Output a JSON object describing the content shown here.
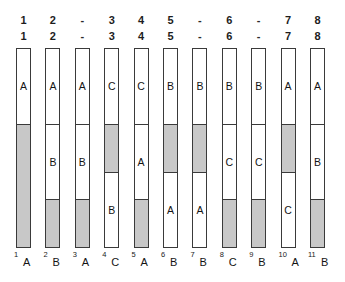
{
  "diagram": {
    "colors": {
      "fill_empty": "#ffffff",
      "fill_shaded": "#c8c8c8",
      "stroke": "#3a3a3a",
      "text": "#141414",
      "background": "#ffffff"
    },
    "header_top": [
      "1",
      "2",
      "-",
      "3",
      "4",
      "5",
      "-",
      "6",
      "-",
      "7",
      "8"
    ],
    "header_bottom": [
      "1",
      "2",
      "-",
      "3",
      "4",
      "5",
      "-",
      "6",
      "-",
      "7",
      "8"
    ],
    "columns": [
      {
        "index": "1",
        "foot_index": "1",
        "foot_letter": "A",
        "segments": [
          {
            "label": "A",
            "fill": "white",
            "height_pct": 38
          },
          {
            "label": "",
            "fill": "gray",
            "height_pct": 62
          }
        ]
      },
      {
        "index": "2",
        "foot_index": "2",
        "foot_letter": "B",
        "segments": [
          {
            "label": "A",
            "fill": "white",
            "height_pct": 38
          },
          {
            "label": "B",
            "fill": "white",
            "height_pct": 38
          },
          {
            "label": "",
            "fill": "gray",
            "height_pct": 24
          }
        ]
      },
      {
        "index": "3",
        "foot_index": "3",
        "foot_letter": "A",
        "segments": [
          {
            "label": "A",
            "fill": "white",
            "height_pct": 38
          },
          {
            "label": "B",
            "fill": "white",
            "height_pct": 38
          },
          {
            "label": "",
            "fill": "gray",
            "height_pct": 24
          }
        ]
      },
      {
        "index": "4",
        "foot_index": "4",
        "foot_letter": "C",
        "segments": [
          {
            "label": "C",
            "fill": "white",
            "height_pct": 38
          },
          {
            "label": "",
            "fill": "gray",
            "height_pct": 24
          },
          {
            "label": "B",
            "fill": "white",
            "height_pct": 38
          }
        ]
      },
      {
        "index": "5",
        "foot_index": "5",
        "foot_letter": "A",
        "segments": [
          {
            "label": "C",
            "fill": "white",
            "height_pct": 38
          },
          {
            "label": "A",
            "fill": "white",
            "height_pct": 38
          },
          {
            "label": "",
            "fill": "gray",
            "height_pct": 24
          }
        ]
      },
      {
        "index": "6",
        "foot_index": "6",
        "foot_letter": "B",
        "segments": [
          {
            "label": "B",
            "fill": "white",
            "height_pct": 38
          },
          {
            "label": "",
            "fill": "gray",
            "height_pct": 24
          },
          {
            "label": "A",
            "fill": "white",
            "height_pct": 38
          }
        ]
      },
      {
        "index": "7",
        "foot_index": "7",
        "foot_letter": "B",
        "segments": [
          {
            "label": "B",
            "fill": "white",
            "height_pct": 38
          },
          {
            "label": "",
            "fill": "gray",
            "height_pct": 24
          },
          {
            "label": "A",
            "fill": "white",
            "height_pct": 38
          }
        ]
      },
      {
        "index": "8",
        "foot_index": "8",
        "foot_letter": "C",
        "segments": [
          {
            "label": "B",
            "fill": "white",
            "height_pct": 38
          },
          {
            "label": "C",
            "fill": "white",
            "height_pct": 38
          },
          {
            "label": "",
            "fill": "gray",
            "height_pct": 24
          }
        ]
      },
      {
        "index": "9",
        "foot_index": "9",
        "foot_letter": "B",
        "segments": [
          {
            "label": "B",
            "fill": "white",
            "height_pct": 38
          },
          {
            "label": "C",
            "fill": "white",
            "height_pct": 38
          },
          {
            "label": "",
            "fill": "gray",
            "height_pct": 24
          }
        ]
      },
      {
        "index": "10",
        "foot_index": "10",
        "foot_letter": "A",
        "segments": [
          {
            "label": "A",
            "fill": "white",
            "height_pct": 38
          },
          {
            "label": "",
            "fill": "gray",
            "height_pct": 24
          },
          {
            "label": "C",
            "fill": "white",
            "height_pct": 38
          }
        ]
      },
      {
        "index": "11",
        "foot_index": "11",
        "foot_letter": "B",
        "segments": [
          {
            "label": "A",
            "fill": "white",
            "height_pct": 38
          },
          {
            "label": "B",
            "fill": "white",
            "height_pct": 38
          },
          {
            "label": "",
            "fill": "gray",
            "height_pct": 24
          }
        ]
      }
    ]
  }
}
